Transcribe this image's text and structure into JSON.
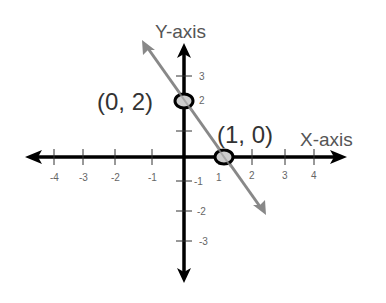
{
  "diagram": {
    "type": "coordinate-plane-line",
    "x_axis_label": "X-axis",
    "y_axis_label": "Y-axis",
    "x_ticks": [
      "-4",
      "-3",
      "-2",
      "-1",
      "1",
      "2",
      "3",
      "4"
    ],
    "y_ticks": [
      "3",
      "2",
      "-1",
      "-2",
      "-3"
    ],
    "points": [
      {
        "label": "(0, 2)",
        "x": 0,
        "y": 2
      },
      {
        "label": "(1, 0)",
        "x": 1,
        "y": 0
      }
    ],
    "line": {
      "equation": "y = -2x + 2",
      "color": "#888888"
    },
    "colors": {
      "axes": "#000000",
      "line": "#888888",
      "point_fill": "#cccccc",
      "point_stroke": "#000000"
    }
  }
}
